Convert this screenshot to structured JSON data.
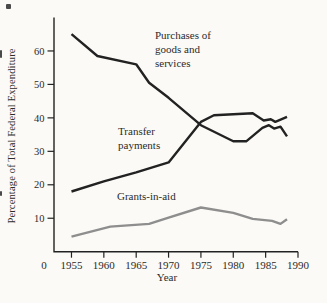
{
  "figure": {
    "background_color": "#fbfaf6",
    "ink_color": "#222222",
    "gray_line_color": "#8e8e8e"
  },
  "chart_data": {
    "type": "line",
    "title": "",
    "xlabel": "Year",
    "ylabel": "Percentage of Total Federal Expenditure",
    "xlim": [
      1952.3,
      1990
    ],
    "ylim": [
      0,
      70
    ],
    "x_ticks": [
      1955,
      1960,
      1965,
      1970,
      1975,
      1980,
      1985,
      1990
    ],
    "x_tick_labels": [
      "1955",
      "1960",
      "1965",
      "1970",
      "1975",
      "1980",
      "1985",
      "1990"
    ],
    "origin_label": "0",
    "y_ticks": [
      10,
      20,
      30,
      40,
      50,
      60
    ],
    "y_tick_labels": [
      "10",
      "20",
      "30",
      "40",
      "50",
      "60"
    ],
    "grid": false,
    "legend": "none (labels placed next to lines)",
    "series": [
      {
        "name": "purchases_of_goods_and_services",
        "label": "Purchases of goods and services",
        "color": "#222222",
        "points": [
          [
            1955,
            65
          ],
          [
            1959,
            58.5
          ],
          [
            1965,
            56
          ],
          [
            1967,
            50.5
          ],
          [
            1970,
            46
          ],
          [
            1975,
            37.8
          ],
          [
            1980,
            33
          ],
          [
            1982,
            33
          ],
          [
            1984.5,
            37
          ],
          [
            1985.5,
            37.8
          ],
          [
            1986.3,
            36.8
          ],
          [
            1987.3,
            37.4
          ],
          [
            1988.3,
            34.5
          ]
        ]
      },
      {
        "name": "transfer_payments",
        "label": "Transfer payments",
        "color": "#222222",
        "points": [
          [
            1955,
            18
          ],
          [
            1960,
            21
          ],
          [
            1965,
            23.7
          ],
          [
            1970,
            26.7
          ],
          [
            1975,
            38.8
          ],
          [
            1977,
            40.8
          ],
          [
            1983,
            41.4
          ],
          [
            1984.7,
            39.2
          ],
          [
            1985.8,
            39.6
          ],
          [
            1986.5,
            38.8
          ],
          [
            1988.3,
            40.3
          ]
        ]
      },
      {
        "name": "grants_in_aid",
        "label": "Grants-in-aid",
        "color": "#8e8e8e",
        "points": [
          [
            1955,
            4.5
          ],
          [
            1961,
            7.5
          ],
          [
            1967,
            8.3
          ],
          [
            1970,
            10.2
          ],
          [
            1975,
            13.2
          ],
          [
            1980,
            11.6
          ],
          [
            1983,
            9.8
          ],
          [
            1986,
            9.2
          ],
          [
            1987.3,
            8.3
          ],
          [
            1988.3,
            9.7
          ]
        ]
      }
    ],
    "annotations": [
      {
        "name": "purchases",
        "lines": [
          "Purchases of",
          "goods and",
          "services"
        ],
        "x": 155,
        "y": 29
      },
      {
        "name": "transfer",
        "lines": [
          "Transfer",
          "payments"
        ],
        "x": 118,
        "y": 125
      },
      {
        "name": "grants",
        "lines": [
          "Grants-in-aid"
        ],
        "x": 117,
        "y": 190
      }
    ]
  }
}
